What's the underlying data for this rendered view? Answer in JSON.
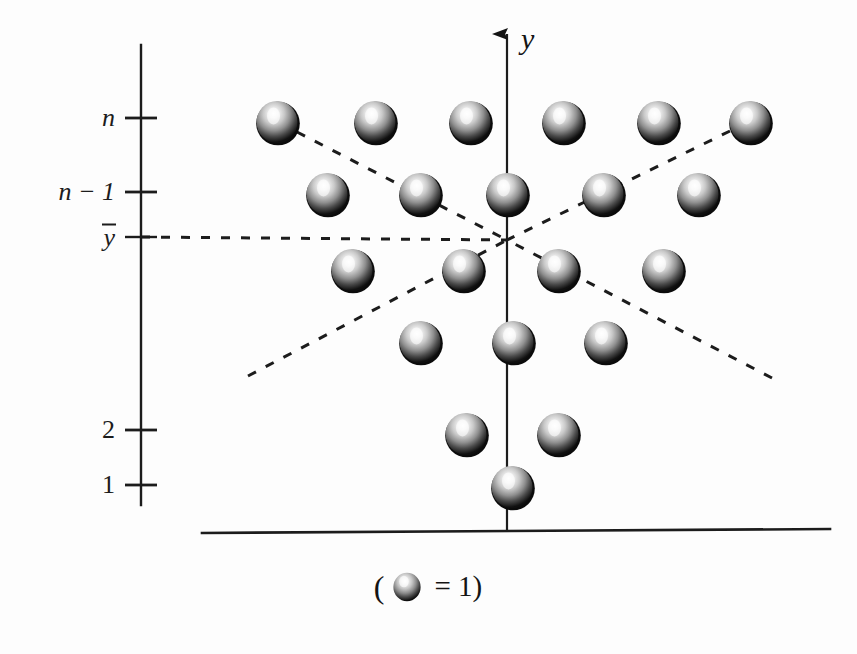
{
  "figure": {
    "title_visible": false,
    "background_color": "#fdfdfd",
    "ink_color": "#1c1c1c"
  },
  "axes": {
    "y_axis": {
      "label": "y",
      "arrow": "up-arrow-icon",
      "x": 507,
      "top_y": 30,
      "bottom_y": 531
    },
    "x_axis": {
      "left_x": 202,
      "right_x": 830,
      "y": 531
    },
    "ruler": {
      "x": 141,
      "top_y": 45,
      "bottom_y": 505,
      "ticks": [
        {
          "label": "n",
          "italic": true,
          "y": 118
        },
        {
          "label": "n − 1",
          "italic": true,
          "y": 192
        },
        {
          "label": "y",
          "overbar": true,
          "italic": true,
          "y": 237
        },
        {
          "label": "2",
          "italic": false,
          "y": 430
        },
        {
          "label": "1",
          "italic": false,
          "y": 485
        }
      ]
    }
  },
  "caption": {
    "open_paren": "(",
    "ball_icon": "sphere-icon",
    "equals_one": "= 1)",
    "full_text": "( ● = 1)"
  },
  "chart_data": {
    "type": "scatter",
    "title": "",
    "xlabel": "",
    "ylabel": "y",
    "legend": "( sphere = 1 )",
    "grid": false,
    "rows": [
      {
        "level_label": "n",
        "count": 6,
        "cy": 122,
        "cx": [
          277,
          375,
          470,
          563,
          658,
          750
        ]
      },
      {
        "level_label": "n − 1",
        "count": 5,
        "cy": 194,
        "cx": [
          327,
          420,
          507,
          603,
          698
        ]
      },
      {
        "level_label": "",
        "count": 4,
        "cy": 270,
        "cx": [
          352,
          463,
          558,
          663
        ]
      },
      {
        "level_label": "",
        "count": 3,
        "cy": 342,
        "cx": [
          420,
          513,
          605
        ]
      },
      {
        "level_label": "2",
        "count": 2,
        "cy": 434,
        "cx": [
          466,
          558
        ]
      },
      {
        "level_label": "1",
        "count": 1,
        "cy": 487,
        "cx": [
          512
        ]
      }
    ],
    "sphere_radius": 21,
    "convergence_point": {
      "x": 507,
      "y": 240,
      "label": "y-bar"
    },
    "dashed_rays": [
      {
        "name": "mean-horizontal",
        "x1": 141,
        "y1": 237,
        "x2": 507,
        "y2": 240
      },
      {
        "name": "upper-left-diagonal",
        "x1": 297,
        "y1": 132,
        "x2": 507,
        "y2": 240
      },
      {
        "name": "upper-right-diagonal",
        "x1": 730,
        "y1": 131,
        "x2": 507,
        "y2": 240
      },
      {
        "name": "lower-left-diagonal",
        "x1": 248,
        "y1": 376,
        "x2": 507,
        "y2": 240
      },
      {
        "name": "lower-right-diagonal",
        "x1": 772,
        "y1": 378,
        "x2": 507,
        "y2": 240
      }
    ],
    "ylim_labels": [
      "1",
      "2",
      "y-bar",
      "n - 1",
      "n"
    ]
  }
}
